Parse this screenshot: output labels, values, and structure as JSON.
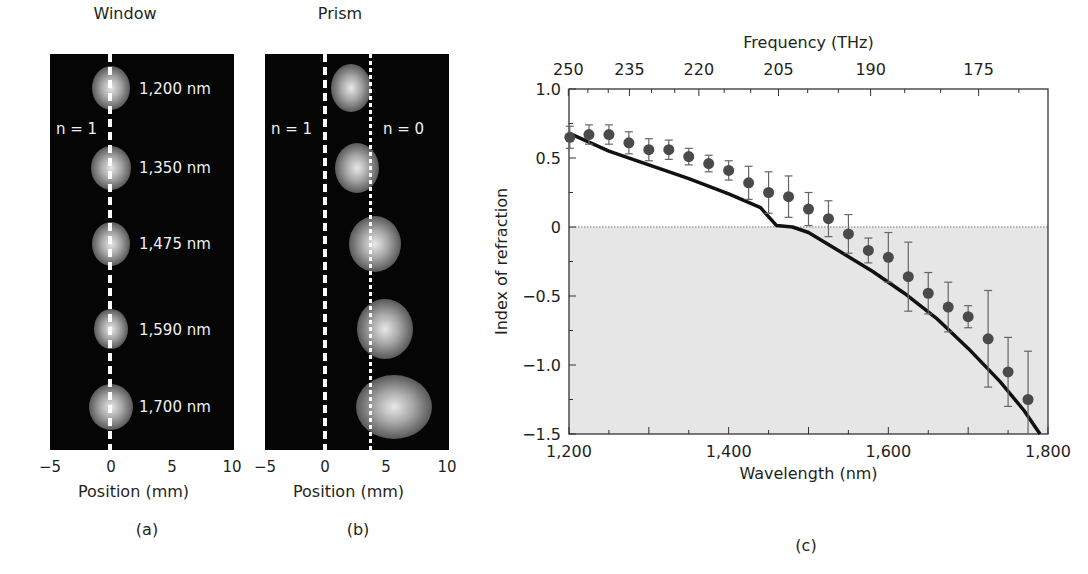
{
  "panels": {
    "a": {
      "title": "Window",
      "caption": "(a)",
      "x_axis_title": "Position (mm)",
      "x_ticks": [
        "−5",
        "0",
        "5",
        "10"
      ],
      "line_label": "n = 1",
      "spot_labels": [
        "1,200 nm",
        "1,350 nm",
        "1,475 nm",
        "1,590 nm",
        "1,700 nm"
      ]
    },
    "b": {
      "title": "Prism",
      "caption": "(b)",
      "x_axis_title": "Position (mm)",
      "x_ticks": [
        "−5",
        "0",
        "5",
        "10"
      ],
      "line_label_left": "n = 1",
      "line_label_right": "n = 0"
    },
    "c": {
      "caption": "(c)"
    }
  },
  "chart_data": [
    {
      "type": "image",
      "title": "Window",
      "xlabel": "Position (mm)",
      "xlim": [
        -5,
        10
      ],
      "xticks": [
        -5,
        0,
        5,
        10
      ],
      "reference_lines": [
        {
          "x": 0,
          "label": "n = 1",
          "style": "dashed"
        }
      ],
      "spots": [
        {
          "wavelength_nm": 1200,
          "label": "1,200 nm",
          "x_mm": 0
        },
        {
          "wavelength_nm": 1350,
          "label": "1,350 nm",
          "x_mm": 0
        },
        {
          "wavelength_nm": 1475,
          "label": "1,475 nm",
          "x_mm": 0
        },
        {
          "wavelength_nm": 1590,
          "label": "1,590 nm",
          "x_mm": 0
        },
        {
          "wavelength_nm": 1700,
          "label": "1,700 nm",
          "x_mm": 0
        }
      ]
    },
    {
      "type": "image",
      "title": "Prism",
      "xlabel": "Position (mm)",
      "xlim": [
        -5,
        10
      ],
      "xticks": [
        -5,
        0,
        5,
        10
      ],
      "reference_lines": [
        {
          "x": 0,
          "label": "n = 1",
          "style": "dashed"
        },
        {
          "x": 3.8,
          "label": "n = 0",
          "style": "dotted"
        }
      ],
      "spots": [
        {
          "wavelength_nm": 1200,
          "x_mm": 2.0
        },
        {
          "wavelength_nm": 1350,
          "x_mm": 2.5
        },
        {
          "wavelength_nm": 1475,
          "x_mm": 4.0
        },
        {
          "wavelength_nm": 1590,
          "x_mm": 4.8
        },
        {
          "wavelength_nm": 1700,
          "x_mm": 5.5
        }
      ]
    },
    {
      "type": "scatter",
      "xlabel": "Wavelength (nm)",
      "ylabel": "Index of refraction",
      "top_xlabel": "Frequency (THz)",
      "xlim": [
        1200,
        1800
      ],
      "ylim": [
        -1.5,
        1.0
      ],
      "xticks": [
        1200,
        1400,
        1600,
        1800
      ],
      "xtick_labels": [
        "1,200",
        "1,400",
        "1,600",
        "1,800"
      ],
      "yticks": [
        1.0,
        0.5,
        0,
        -0.5,
        -1.0,
        -1.5
      ],
      "ytick_labels": [
        "1.0",
        "0.5",
        "0",
        "−0.5",
        "−1.0",
        "−1.5"
      ],
      "top_ticks": [
        250,
        235,
        220,
        205,
        190,
        175
      ],
      "top_tick_labels": [
        "250",
        "235",
        "220",
        "205",
        "190",
        "175"
      ],
      "shaded_region": {
        "y_from": -1.5,
        "y_to": 0,
        "color": "#e6e6e6"
      },
      "zero_line": {
        "y": 0,
        "style": "dotted"
      },
      "series": [
        {
          "name": "measured",
          "marker": "circle",
          "color": "#4a4a4a",
          "x": [
            1201,
            1225,
            1250,
            1275,
            1300,
            1325,
            1350,
            1375,
            1400,
            1425,
            1450,
            1475,
            1500,
            1525,
            1550,
            1575,
            1600,
            1625,
            1650,
            1675,
            1700,
            1725,
            1750,
            1775
          ],
          "y": [
            0.65,
            0.67,
            0.67,
            0.61,
            0.56,
            0.56,
            0.51,
            0.46,
            0.41,
            0.32,
            0.25,
            0.22,
            0.13,
            0.06,
            -0.05,
            -0.17,
            -0.22,
            -0.36,
            -0.48,
            -0.58,
            -0.65,
            -0.81,
            -1.05,
            -1.25
          ],
          "err": [
            0.08,
            0.07,
            0.07,
            0.08,
            0.08,
            0.07,
            0.06,
            0.06,
            0.07,
            0.12,
            0.15,
            0.15,
            0.12,
            0.13,
            0.14,
            0.09,
            0.18,
            0.25,
            0.15,
            0.18,
            0.08,
            0.35,
            0.25,
            0.35
          ]
        },
        {
          "name": "theory",
          "type": "line",
          "color": "#111111",
          "x": [
            1200,
            1250,
            1300,
            1350,
            1400,
            1440,
            1460,
            1480,
            1500,
            1540,
            1580,
            1620,
            1660,
            1700,
            1740,
            1770,
            1790
          ],
          "y": [
            0.68,
            0.55,
            0.45,
            0.35,
            0.24,
            0.14,
            0.01,
            0.0,
            -0.04,
            -0.18,
            -0.32,
            -0.48,
            -0.66,
            -0.88,
            -1.12,
            -1.33,
            -1.5
          ]
        }
      ]
    }
  ]
}
